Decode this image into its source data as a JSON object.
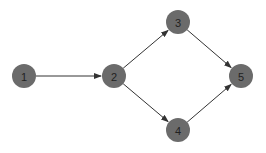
{
  "diagram": {
    "type": "directed-graph",
    "node_color": "#6b6b6b",
    "edge_color": "#333333",
    "label_color": "#222222",
    "nodes": [
      {
        "id": "1",
        "label": "1",
        "x": 24,
        "y": 76,
        "r": 12
      },
      {
        "id": "2",
        "label": "2",
        "x": 114,
        "y": 76,
        "r": 12
      },
      {
        "id": "3",
        "label": "3",
        "x": 178,
        "y": 22,
        "r": 12
      },
      {
        "id": "4",
        "label": "4",
        "x": 178,
        "y": 130,
        "r": 12
      },
      {
        "id": "5",
        "label": "5",
        "x": 241,
        "y": 76,
        "r": 12
      }
    ],
    "edges": [
      {
        "from": "1",
        "to": "2"
      },
      {
        "from": "2",
        "to": "3"
      },
      {
        "from": "2",
        "to": "4"
      },
      {
        "from": "3",
        "to": "5"
      },
      {
        "from": "4",
        "to": "5"
      }
    ]
  }
}
